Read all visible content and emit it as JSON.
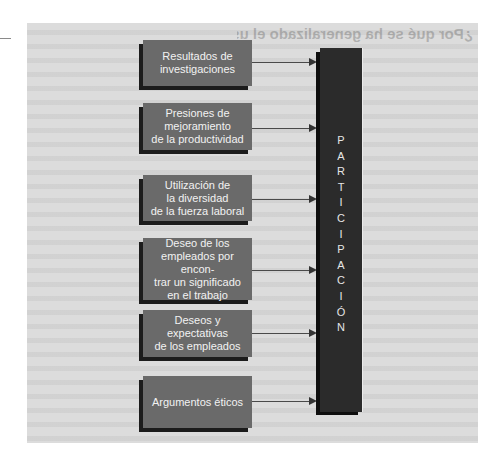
{
  "diagram": {
    "type": "flow-into-target",
    "background_heading_bleed": "¿Por qué se ha generalizado el uso de la participación?",
    "colors": {
      "panel": "#dcdcdc",
      "box_fill": "#6a6a6a",
      "box_shadow": "#1c1c1c",
      "box_text": "#f2f2f2",
      "bar_fill": "#2b2b2b",
      "bar_text": "#e6e6e6",
      "arrow": "#4a4a4a"
    },
    "sources": [
      {
        "label": "Resultados de\ninvestigaciones"
      },
      {
        "label": "Presiones de\nmejoramiento\nde la productividad"
      },
      {
        "label": "Utilización de\nla diversidad\nde la fuerza laboral"
      },
      {
        "label": "Deseo de los\nempleados por encon-\ntrar un significado\nen el trabajo"
      },
      {
        "label": "Deseos y expectativas\nde los empleados"
      },
      {
        "label": "Argumentos éticos"
      }
    ],
    "target": {
      "label": "PARTICIPACIÓN",
      "letters": [
        "P",
        "A",
        "R",
        "T",
        "I",
        "C",
        "I",
        "P",
        "A",
        "C",
        "I",
        "Ó",
        "N"
      ]
    }
  }
}
